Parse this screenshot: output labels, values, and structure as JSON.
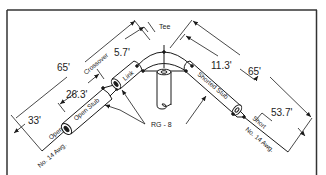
{
  "diagram": {
    "title_label": "Tee",
    "cable_label": "RG - 8",
    "left": {
      "total_length": "65'",
      "open_section_length": "33'",
      "open_stub_length": "26.3'",
      "link_length": "5.7'",
      "crossover_label": "Crossover",
      "link_label": "Link",
      "open_stub_label": "Open Stub",
      "end_label": "Open",
      "wire_label": "No. 14 Awg."
    },
    "right": {
      "total_length": "65'",
      "shorted_stub_length": "11.3'",
      "short_section_length": "53.7'",
      "shorted_stub_label": "Shorted Stub",
      "end_label": "Short",
      "wire_label": "No. 14 Awg."
    },
    "colors": {
      "line": "#1a1a1a",
      "background": "#ffffff",
      "frame": "#333333"
    }
  }
}
